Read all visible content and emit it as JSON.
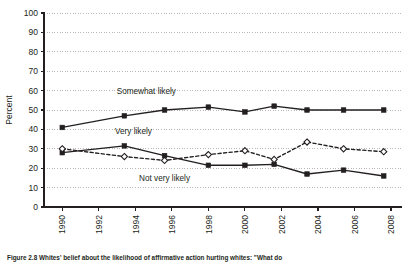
{
  "figure": {
    "caption": "Figure 2.8  Whites' belief about the likelihood of affirmative action hurting whites: \"What do"
  },
  "chart_data": {
    "type": "line",
    "title": "",
    "xlabel": "",
    "ylabel": "Percent",
    "ylim": [
      0,
      100
    ],
    "ytick_step": 10,
    "yticks": [
      "0",
      "10",
      "20",
      "30",
      "40",
      "50",
      "60",
      "70",
      "80",
      "90",
      "100"
    ],
    "xlim": [
      1989,
      2008.6
    ],
    "xticks": [
      "1990",
      "1992",
      "1994",
      "1996",
      "1998",
      "2000",
      "2002",
      "2004",
      "2006",
      "2008"
    ],
    "grid": "horizontal-dotted",
    "legend": "inline-labels",
    "x": [
      1990,
      1993.4,
      1995.6,
      1998,
      2000,
      2001.6,
      2003.4,
      2005.4,
      2007.6
    ],
    "series": [
      {
        "name": "Somewhat likely",
        "style": "solid",
        "marker": "filled-square",
        "color": "#231f20",
        "values": [
          41,
          47,
          50,
          51.5,
          49,
          52,
          50,
          50,
          50
        ],
        "label_x": 1994.6,
        "label_y": 58
      },
      {
        "name": "Very likely",
        "style": "solid",
        "marker": "filled-square",
        "color": "#231f20",
        "values": [
          28,
          31.5,
          26.5,
          21.5,
          21.5,
          22,
          17,
          19,
          16
        ],
        "label_x": 1993.9,
        "label_y": 37.5
      },
      {
        "name": "Not very likely",
        "style": "dashed",
        "marker": "open-diamond",
        "color": "#231f20",
        "values": [
          30,
          26,
          24,
          27,
          29,
          24.5,
          33.5,
          30,
          28.5
        ],
        "label_x": 1995.6,
        "label_y": 13.5
      }
    ]
  }
}
